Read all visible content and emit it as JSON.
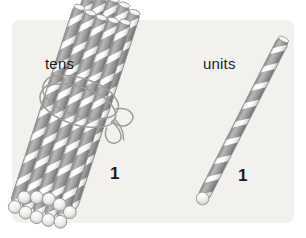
{
  "illustration": {
    "title": "Place value straws: tens and units",
    "background_color": "#ffffff",
    "panel_color": "#f2f1ee",
    "stripe_color": "#9a9a9a",
    "stripe_dark_color": "#7d7d7d",
    "straw_body_color": "#fbfbfa",
    "outline_color": "#8c8c8c",
    "string_color": "#b5b5b5"
  },
  "groups": [
    {
      "id": "tens",
      "label": "tens",
      "count": "1",
      "item_count": 10,
      "bundled": true,
      "tie": "string-bow"
    },
    {
      "id": "units",
      "label": "units",
      "count": "1",
      "item_count": 1,
      "bundled": false,
      "tie": ""
    }
  ]
}
